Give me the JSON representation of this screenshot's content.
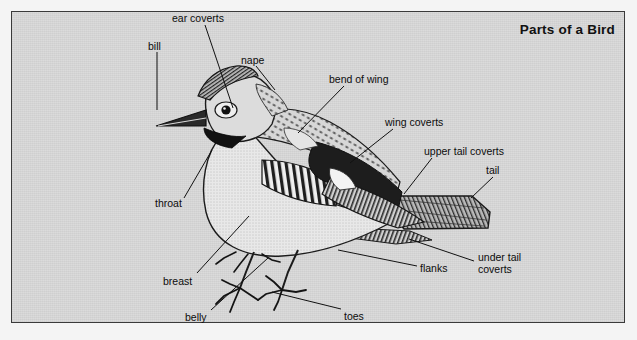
{
  "page": {
    "title": "Parts of a Bird",
    "background_color": "#dadada",
    "frame_color": "#3a3a3a",
    "outer_color": "#f4f4f4",
    "ink_color": "#111111"
  },
  "diagram": {
    "subject": "bird",
    "illustration_style": "engraved line drawing halftone",
    "labels": [
      {
        "id": "ear-coverts",
        "text": "ear coverts",
        "x": 172,
        "y": 13,
        "leader": [
          [
            205,
            25
          ],
          [
            233,
            108
          ]
        ]
      },
      {
        "id": "bill",
        "text": "bill",
        "x": 148,
        "y": 41,
        "leader": [
          [
            157,
            52
          ],
          [
            157,
            110
          ]
        ]
      },
      {
        "id": "nape",
        "text": "nape",
        "x": 241,
        "y": 55,
        "leader": [
          [
            256,
            66
          ],
          [
            275,
            90
          ]
        ]
      },
      {
        "id": "bend-of-wing",
        "text": "bend of wing",
        "x": 329,
        "y": 74,
        "leader": [
          [
            344,
            86
          ],
          [
            298,
            133
          ]
        ]
      },
      {
        "id": "wing-coverts",
        "text": "wing coverts",
        "x": 385,
        "y": 117,
        "leader": [
          [
            393,
            129
          ],
          [
            350,
            163
          ]
        ]
      },
      {
        "id": "upper-tail-coverts",
        "text": "upper tail coverts",
        "x": 424,
        "y": 146,
        "leader": [
          [
            432,
            158
          ],
          [
            404,
            194
          ]
        ]
      },
      {
        "id": "tail",
        "text": "tail",
        "x": 486,
        "y": 165,
        "leader": [
          [
            493,
            177
          ],
          [
            471,
            198
          ]
        ]
      },
      {
        "id": "throat",
        "text": "throat",
        "x": 155,
        "y": 198,
        "leader": [
          [
            184,
            198
          ],
          [
            212,
            150
          ]
        ]
      },
      {
        "id": "breast",
        "text": "breast",
        "x": 163,
        "y": 276,
        "leader": [
          [
            197,
            273
          ],
          [
            249,
            216
          ]
        ]
      },
      {
        "id": "belly",
        "text": "belly",
        "x": 185,
        "y": 312,
        "leader": [
          [
            211,
            310
          ],
          [
            268,
            258
          ]
        ]
      },
      {
        "id": "toes",
        "text": "toes",
        "x": 344,
        "y": 311,
        "leader": [
          [
            341,
            309
          ],
          [
            272,
            292
          ]
        ]
      },
      {
        "id": "flanks",
        "text": "flanks",
        "x": 420,
        "y": 263,
        "leader": [
          [
            417,
            266
          ],
          [
            338,
            250
          ]
        ]
      },
      {
        "id": "under-tail-coverts",
        "text": "under tail coverts",
        "x": 478,
        "y": 252,
        "leader": [
          [
            474,
            261
          ],
          [
            409,
            239
          ]
        ]
      }
    ]
  }
}
